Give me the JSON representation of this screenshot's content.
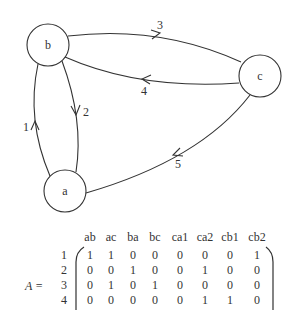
{
  "graph": {
    "nodes": [
      {
        "id": "a",
        "label": "a",
        "cx": 65,
        "cy": 191,
        "r": 21
      },
      {
        "id": "b",
        "label": "b",
        "cx": 48,
        "cy": 45,
        "r": 21
      },
      {
        "id": "c",
        "label": "c",
        "cx": 260,
        "cy": 76,
        "r": 21
      }
    ],
    "edges": [
      {
        "id": "1",
        "label": "1",
        "from": "a",
        "to": "b"
      },
      {
        "id": "2",
        "label": "2",
        "from": "b",
        "to": "a"
      },
      {
        "id": "3",
        "label": "3",
        "from": "b",
        "to": "c"
      },
      {
        "id": "4",
        "label": "4",
        "from": "c",
        "to": "b"
      },
      {
        "id": "5",
        "label": "5",
        "from": "c",
        "to": "a"
      }
    ]
  },
  "matrix": {
    "name": "A =",
    "columns": [
      "ab",
      "ac",
      "ba",
      "bc",
      "ca1",
      "ca2",
      "cb1",
      "cb2"
    ],
    "rows": [
      {
        "label": "1",
        "values": [
          "1",
          "1",
          "0",
          "0",
          "0",
          "0",
          "0",
          "1"
        ]
      },
      {
        "label": "2",
        "values": [
          "0",
          "0",
          "1",
          "0",
          "0",
          "1",
          "0",
          "0"
        ]
      },
      {
        "label": "3",
        "values": [
          "0",
          "1",
          "0",
          "1",
          "0",
          "0",
          "0",
          "0"
        ]
      },
      {
        "label": "4",
        "values": [
          "0",
          "0",
          "0",
          "0",
          "0",
          "1",
          "1",
          "0"
        ]
      }
    ]
  }
}
